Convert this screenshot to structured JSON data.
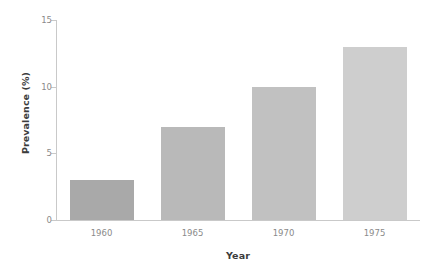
{
  "chart_data": {
    "type": "bar",
    "title": "",
    "xlabel": "Year",
    "ylabel": "Prevalence (%)",
    "categories": [
      "1960",
      "1965",
      "1970",
      "1975"
    ],
    "values": [
      3,
      7,
      10,
      13
    ],
    "series": [
      {
        "name": "Prevalence",
        "values": [
          3,
          7,
          10,
          13
        ]
      }
    ],
    "ylim": [
      0,
      15
    ],
    "yticks": [
      0,
      5,
      10,
      15
    ],
    "ytick_labels": [
      "0",
      "5",
      "10",
      "15"
    ],
    "xtick_labels": [
      "1960",
      "1965",
      "1970",
      "1975"
    ],
    "grid": false,
    "legend": false,
    "legend_position": "none",
    "bar_colors": [
      "#a9a9a9",
      "#b9b9b9",
      "#c1c1c1",
      "#cecece"
    ],
    "axis_color": "#c9c9c9",
    "tick_label_color": "#8a8a8a",
    "axis_title_color": "#3c3c3c",
    "background_color": "#ffffff"
  }
}
